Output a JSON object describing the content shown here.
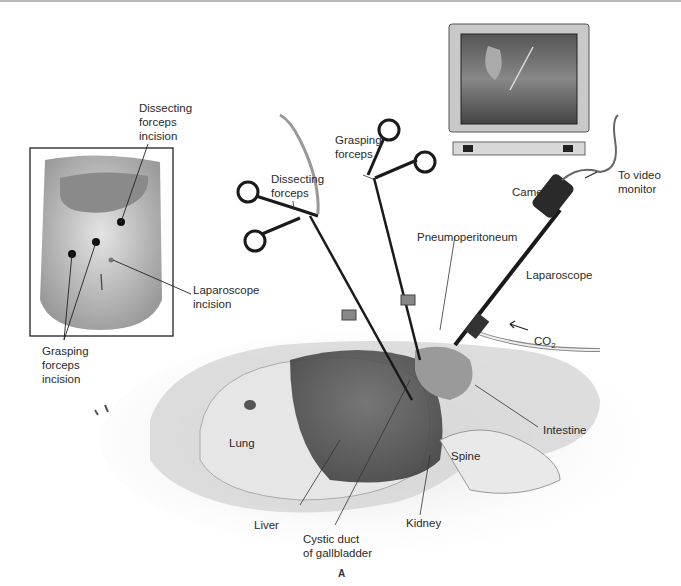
{
  "figure": {
    "caption_letter": "A",
    "inset_labels": {
      "dissecting_incision": "Dissecting\nforceps\nincision",
      "laparoscope_incision": "Laparoscope\nincision",
      "grasping_incision": "Grasping\nforceps\nincision"
    },
    "instrument_labels": {
      "dissecting_forceps": "Dissecting\nforceps",
      "grasping_forceps": "Grasping\nforceps",
      "camera": "Camera",
      "to_video_monitor": "To video\nmonitor",
      "pneumoperitoneum": "Pneumoperitoneum",
      "laparoscope": "Laparoscope",
      "co2": "CO",
      "co2_sub": "2"
    },
    "anatomy_labels": {
      "lung": "Lung",
      "liver": "Liver",
      "cystic_duct": "Cystic duct\nof gallbladder",
      "kidney": "Kidney",
      "spine": "Spine",
      "intestine": "Intestine"
    }
  }
}
